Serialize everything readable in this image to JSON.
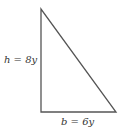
{
  "diagram": {
    "shape": "right-triangle",
    "height_label": "h = 8y",
    "base_label": "b = 6y",
    "stroke_color": "#555555",
    "vertices": [
      [
        41,
        9
      ],
      [
        41,
        112
      ],
      [
        116,
        112
      ]
    ]
  }
}
